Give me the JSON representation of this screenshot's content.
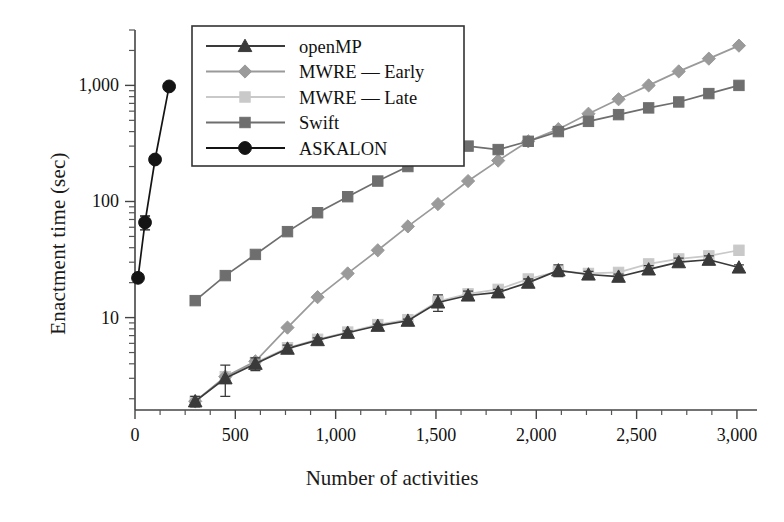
{
  "chart_data": {
    "type": "line",
    "title": "",
    "xlabel": "Number of activities",
    "ylabel": "Enactment time (sec)",
    "xlim": [
      0,
      3100
    ],
    "ylim": [
      1.6,
      3000
    ],
    "yscale": "log",
    "xticks": [
      0,
      500,
      1000,
      1500,
      2000,
      2500,
      3000
    ],
    "xticklabels": [
      "0",
      "500",
      "1,000",
      "1,500",
      "2,000",
      "2,500",
      "3,000"
    ],
    "yticks": [
      10,
      100,
      1000
    ],
    "yticklabels": [
      "10",
      "100",
      "1,000"
    ],
    "grid": false,
    "legend_position": "upper-left",
    "series": [
      {
        "name": "openMP",
        "marker": "triangle",
        "color": "#3a3a3a",
        "line_color": "#3a3a3a",
        "x": [
          300,
          450,
          600,
          760,
          910,
          1060,
          1210,
          1360,
          1510,
          1660,
          1810,
          1960,
          2110,
          2260,
          2410,
          2560,
          2710,
          2860,
          3010
        ],
        "y": [
          1.9,
          3.0,
          4.0,
          5.4,
          6.4,
          7.4,
          8.5,
          9.4,
          13.5,
          15.5,
          16.5,
          20.0,
          25.5,
          23.5,
          22.5,
          26.0,
          30.0,
          31.5,
          27.0
        ],
        "yerr": [
          0.2,
          0.9,
          0.5,
          0.4,
          0.3,
          0.3,
          0.3,
          0.3,
          2.2,
          1.4,
          1.0,
          1.5,
          3.0,
          1.5,
          1.2,
          2.0,
          2.5,
          2.5,
          1.5
        ]
      },
      {
        "name": "MWRE — Late",
        "marker": "square",
        "color": "#c9c9c9",
        "line_color": "#c9c9c9",
        "x": [
          300,
          450,
          600,
          760,
          910,
          1060,
          1210,
          1360,
          1510,
          1660,
          1810,
          1960,
          2110,
          2260,
          2410,
          2560,
          2710,
          2860,
          3010
        ],
        "y": [
          1.9,
          3.1,
          4.1,
          5.5,
          6.5,
          7.5,
          8.7,
          9.6,
          13.8,
          16.0,
          17.5,
          21.5,
          25.0,
          24.0,
          24.5,
          29.0,
          32.0,
          34.0,
          38.0
        ],
        "yerr": [
          0,
          0,
          0,
          0,
          0,
          0,
          0,
          0,
          0,
          0,
          0,
          0,
          0,
          0,
          0,
          0,
          0,
          0,
          0
        ]
      },
      {
        "name": "MWRE — Early",
        "marker": "diamond",
        "color": "#9a9a9a",
        "line_color": "#9a9a9a",
        "x": [
          300,
          450,
          600,
          760,
          910,
          1060,
          1210,
          1360,
          1510,
          1660,
          1810,
          1960,
          2110,
          2260,
          2410,
          2560,
          2710,
          2860,
          3010
        ],
        "y": [
          1.9,
          3.1,
          4.2,
          8.2,
          15.0,
          24.0,
          38.0,
          61.0,
          95.0,
          150.0,
          225.0,
          330.0,
          420.0,
          570.0,
          760.0,
          1000.0,
          1320.0,
          1700.0,
          2200.0
        ],
        "yerr": [
          0,
          0,
          0,
          0,
          0,
          0,
          0,
          0,
          0,
          0,
          0,
          0,
          0,
          0,
          0,
          0,
          0,
          0,
          0
        ]
      },
      {
        "name": "Swift",
        "marker": "square",
        "color": "#6e6e6e",
        "line_color": "#6e6e6e",
        "x": [
          300,
          450,
          600,
          760,
          910,
          1060,
          1210,
          1360,
          1510,
          1660,
          1810,
          1960,
          2110,
          2260,
          2410,
          2560,
          2710,
          2860,
          3010
        ],
        "y": [
          14.0,
          23.0,
          35.0,
          55.0,
          80.0,
          110.0,
          150.0,
          200.0,
          285.0,
          300.0,
          280.0,
          330.0,
          400.0,
          490.0,
          560.0,
          640.0,
          720.0,
          850.0,
          1000.0
        ],
        "yerr": [
          0,
          0,
          0,
          0,
          0,
          0,
          0,
          0,
          0,
          0,
          0,
          0,
          0,
          0,
          0,
          0,
          0,
          0,
          0
        ]
      },
      {
        "name": "ASKALON",
        "marker": "circle",
        "color": "#141414",
        "line_color": "#141414",
        "x": [
          15,
          50,
          100,
          170
        ],
        "y": [
          22.0,
          66.0,
          230.0,
          980.0
        ],
        "yerr": [
          0,
          9,
          0,
          0
        ]
      }
    ],
    "legend_entries": [
      {
        "label": "openMP",
        "marker": "triangle",
        "color": "#3a3a3a"
      },
      {
        "label": "MWRE — Early",
        "marker": "diamond",
        "color": "#9a9a9a"
      },
      {
        "label": "MWRE — Late",
        "marker": "square",
        "color": "#c9c9c9"
      },
      {
        "label": "Swift",
        "marker": "square",
        "color": "#6e6e6e"
      },
      {
        "label": "ASKALON",
        "marker": "circle",
        "color": "#141414"
      }
    ]
  },
  "axes": {
    "ylabel_text": "Enactment time (sec)",
    "xlabel_text": "Number of activities"
  }
}
